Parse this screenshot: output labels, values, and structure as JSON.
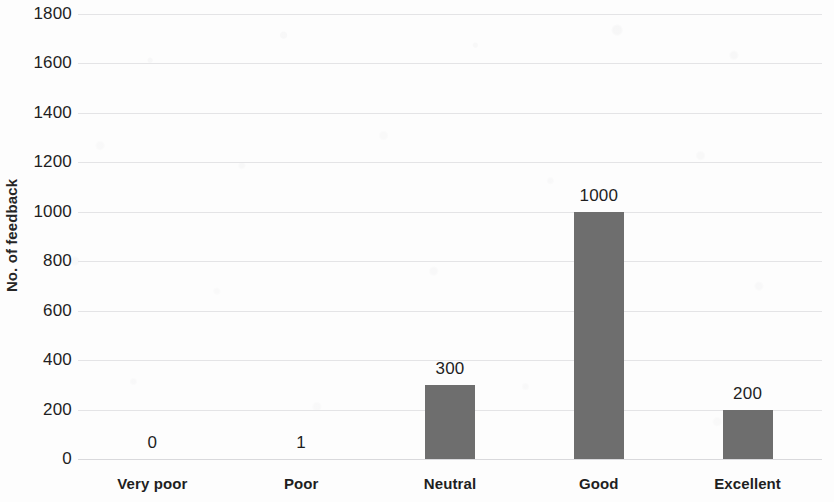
{
  "chart_data": {
    "type": "bar",
    "title": "",
    "subtitle": "",
    "xlabel": "",
    "ylabel": "No. of feedback",
    "categories": [
      "Very poor",
      "Poor",
      "Neutral",
      "Good",
      "Excellent"
    ],
    "values": [
      0,
      1,
      300,
      1000,
      200
    ],
    "data_labels": [
      "0",
      "1",
      "300",
      "1000",
      "200"
    ],
    "series": [
      {
        "name": "No. of feedback",
        "values": [
          0,
          1,
          300,
          1000,
          200
        ]
      }
    ],
    "ylim": [
      0,
      1800
    ],
    "y_tick_step": 200,
    "y_tick_labels": [
      "1800",
      "1600",
      "1400",
      "1200",
      "1000",
      "800",
      "600",
      "400",
      "200",
      "0"
    ],
    "y_tick_values": [
      1800,
      1600,
      1400,
      1200,
      1000,
      800,
      600,
      400,
      200,
      0
    ],
    "grid": true,
    "grid_axis": "y",
    "legend": false,
    "legend_position": "none",
    "bar_color": "#6e6e6e",
    "gridline_color": "#e4e4e6",
    "background_color": "#fdfdfd",
    "text_color": "#1f1f1f",
    "data_labels_shown": true
  }
}
